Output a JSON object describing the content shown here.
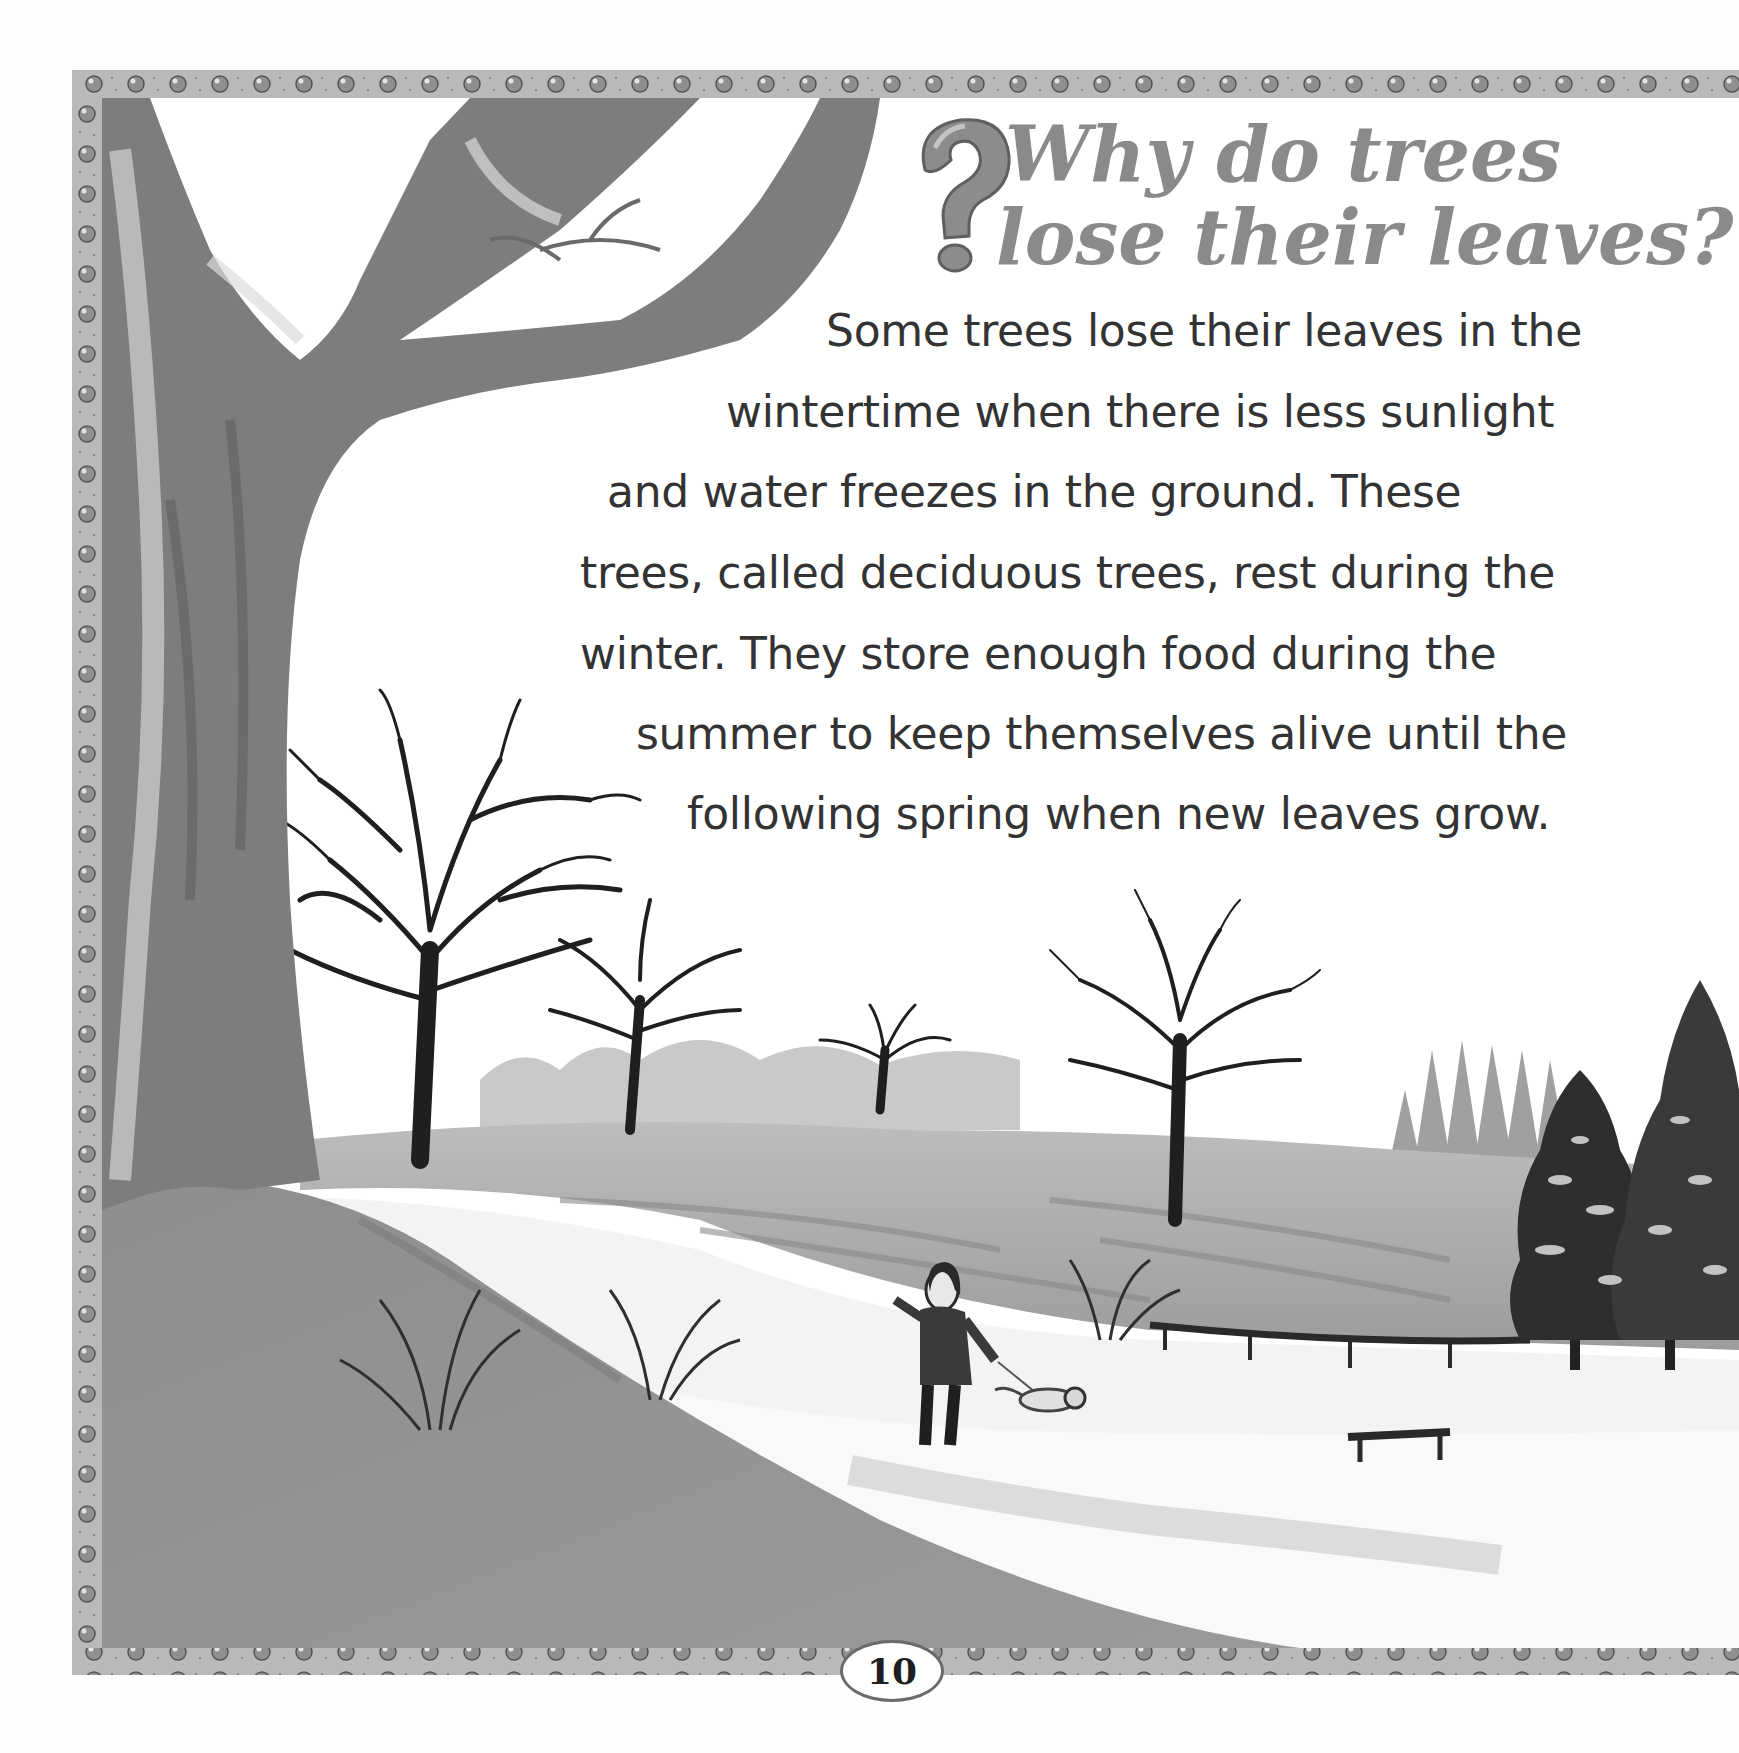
{
  "page": {
    "title_lines": [
      "Why do trees",
      "lose their leaves?"
    ],
    "title_icon": "question-mark-icon",
    "body_lines": [
      "Some trees lose their leaves in the",
      "wintertime when there is less sunlight",
      "and water freezes in the ground. These",
      "trees, called deciduous trees, rest during the",
      "winter. They store enough food during the",
      "summer to keep themselves alive until the",
      "following spring when new leaves grow."
    ],
    "page_number": "10"
  },
  "illustration": {
    "subject": "winter park landscape with bare deciduous trees, snow-covered hills, evergreen trees, a woman walking a dog, fence and bench",
    "elements": [
      "large-tree-trunk-icon",
      "bare-tree-icon",
      "evergreen-tree-icon",
      "person-walking-icon",
      "dog-icon",
      "fence-icon",
      "bench-icon"
    ]
  },
  "border": {
    "icons": [
      "pear-icon",
      "car-icon",
      "fish-icon",
      "eye-icon",
      "rainbow-icon",
      "flower-icon",
      "battery-icon",
      "clock-icon",
      "rocket-icon",
      "teddy-bear-icon",
      "bug-icon",
      "splat-icon",
      "cherries-icon",
      "telescope-icon",
      "skull-icon"
    ]
  },
  "colors": {
    "title": "#8a8a8a",
    "body_text": "#333333",
    "border_band": "#b9b9b9",
    "trunk": "#7c7c7c",
    "snow": "#f4f4f4",
    "hill_shade": "#a8a8a8"
  }
}
